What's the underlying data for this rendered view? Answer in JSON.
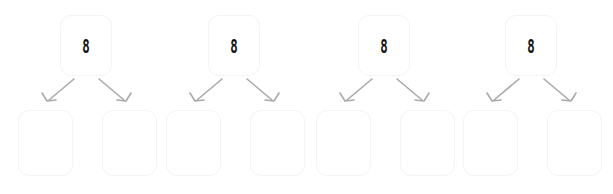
{
  "diagram": {
    "type": "binary-tree-forest",
    "background_color": "#ffffff",
    "node_fill_color": "#ffffff",
    "node_border_color": "#f4f4f5",
    "edge_color": "#a9a9ad",
    "label_color": "#131316",
    "group_count": 4,
    "group_spacing_px": 153,
    "groups": [
      {
        "name": "tree-1",
        "root": {
          "label": "8"
        },
        "children": [
          {
            "label": "",
            "position": "left"
          },
          {
            "label": "",
            "position": "right"
          }
        ],
        "edges": [
          {
            "from": "root",
            "to": "left-child",
            "arrow": "down-left"
          },
          {
            "from": "root",
            "to": "right-child",
            "arrow": "down-right"
          }
        ]
      },
      {
        "name": "tree-2",
        "root": {
          "label": "8"
        },
        "children": [
          {
            "label": "",
            "position": "left"
          },
          {
            "label": "",
            "position": "right"
          }
        ],
        "edges": [
          {
            "from": "root",
            "to": "left-child",
            "arrow": "down-left"
          },
          {
            "from": "root",
            "to": "right-child",
            "arrow": "down-right"
          }
        ]
      },
      {
        "name": "tree-3",
        "root": {
          "label": "8"
        },
        "children": [
          {
            "label": "",
            "position": "left"
          },
          {
            "label": "",
            "position": "right"
          }
        ],
        "edges": [
          {
            "from": "root",
            "to": "left-child",
            "arrow": "down-left"
          },
          {
            "from": "root",
            "to": "right-child",
            "arrow": "down-right"
          }
        ]
      },
      {
        "name": "tree-4",
        "root": {
          "label": "8"
        },
        "children": [
          {
            "label": "",
            "position": "left"
          },
          {
            "label": "",
            "position": "right"
          }
        ],
        "edges": [
          {
            "from": "root",
            "to": "left-child",
            "arrow": "down-left"
          },
          {
            "from": "root",
            "to": "right-child",
            "arrow": "down-right"
          }
        ]
      }
    ]
  }
}
